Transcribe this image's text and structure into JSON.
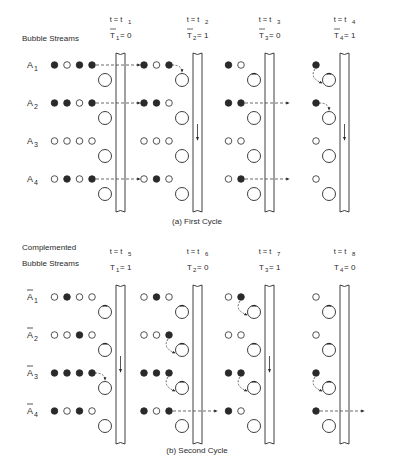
{
  "panels": [
    {
      "id": "a",
      "header_label": [
        "Bubble Streams"
      ],
      "caption": "(a) First Cycle",
      "row_labels": [
        "A1",
        "A2",
        "A3",
        "A4"
      ],
      "row_label_bar": false,
      "columns": [
        {
          "time": "t = t1",
          "time_sub": "1",
          "control": "T1 = 0",
          "control_name": "T",
          "control_sub": "1",
          "control_value": "0",
          "control_bar": true,
          "channel_flow_down": false,
          "rows": [
            {
              "bits": [
                1,
                0,
                1,
                1
              ],
              "hole_dot": false,
              "action": "transfer-out"
            },
            {
              "bits": [
                1,
                1,
                0,
                1
              ],
              "hole_dot": false,
              "action": "transfer-out"
            },
            {
              "bits": [
                0,
                0,
                0,
                0
              ],
              "hole_dot": false,
              "action": "none"
            },
            {
              "bits": [
                0,
                1,
                0,
                1
              ],
              "hole_dot": false,
              "action": "transfer-out"
            }
          ]
        },
        {
          "time": "t = t2",
          "time_sub": "2",
          "control": "T2 = 1",
          "control_name": "T",
          "control_sub": "2",
          "control_value": "1",
          "control_bar": true,
          "channel_flow_down": true,
          "rows": [
            {
              "bits": [
                1,
                0,
                1
              ],
              "hole_dot": false,
              "action": "drop-into-hole"
            },
            {
              "bits": [
                1,
                1,
                0
              ],
              "hole_dot": false,
              "action": "none"
            },
            {
              "bits": [
                0,
                0,
                0
              ],
              "hole_dot": false,
              "action": "none"
            },
            {
              "bits": [
                0,
                1,
                0
              ],
              "hole_dot": false,
              "action": "none"
            }
          ]
        },
        {
          "time": "t = t3",
          "time_sub": "3",
          "control": "T3 = 0",
          "control_name": "T",
          "control_sub": "3",
          "control_value": "0",
          "control_bar": true,
          "channel_flow_down": false,
          "rows": [
            {
              "bits": [
                1,
                0
              ],
              "hole_dot": true,
              "action": "none"
            },
            {
              "bits": [
                1,
                1
              ],
              "hole_dot": false,
              "action": "transfer-out"
            },
            {
              "bits": [
                0,
                0
              ],
              "hole_dot": false,
              "action": "none"
            },
            {
              "bits": [
                0,
                1
              ],
              "hole_dot": false,
              "action": "transfer-out"
            }
          ]
        },
        {
          "time": "t = t4",
          "time_sub": "4",
          "control": "T4 = 1",
          "control_name": "T",
          "control_sub": "4",
          "control_value": "1",
          "control_bar": true,
          "channel_flow_down": true,
          "rows": [
            {
              "bits": [
                1
              ],
              "hole_dot": true,
              "action": "curve-down"
            },
            {
              "bits": [
                1
              ],
              "hole_dot": false,
              "action": "drop-into-hole"
            },
            {
              "bits": [
                0
              ],
              "hole_dot": false,
              "action": "none"
            },
            {
              "bits": [
                0
              ],
              "hole_dot": false,
              "action": "none"
            }
          ]
        }
      ]
    },
    {
      "id": "b",
      "header_label": [
        "Complemented",
        "Bubble Streams"
      ],
      "caption": "(b) Second Cycle",
      "row_labels": [
        "Ā1",
        "Ā2",
        "Ā3",
        "Ā4"
      ],
      "row_label_bar": true,
      "columns": [
        {
          "time": "t = t5",
          "time_sub": "5",
          "control": "T1 = 1",
          "control_name": "T",
          "control_sub": "1",
          "control_value": "1",
          "control_bar": false,
          "channel_flow_down": true,
          "rows": [
            {
              "bits": [
                0,
                1,
                0,
                0
              ],
              "hole_dot": true,
              "action": "none"
            },
            {
              "bits": [
                0,
                0,
                1,
                0
              ],
              "hole_dot": true,
              "action": "none"
            },
            {
              "bits": [
                1,
                1,
                1,
                1
              ],
              "hole_dot": false,
              "action": "drop-into-hole"
            },
            {
              "bits": [
                1,
                0,
                1,
                0
              ],
              "hole_dot": false,
              "action": "none"
            }
          ]
        },
        {
          "time": "t = t6",
          "time_sub": "6",
          "control": "T2 = 0",
          "control_name": "T",
          "control_sub": "2",
          "control_value": "0",
          "control_bar": false,
          "channel_flow_down": false,
          "rows": [
            {
              "bits": [
                0,
                1,
                0
              ],
              "hole_dot": true,
              "action": "none"
            },
            {
              "bits": [
                0,
                0,
                1
              ],
              "hole_dot": true,
              "action": "curve-down"
            },
            {
              "bits": [
                1,
                1,
                1
              ],
              "hole_dot": true,
              "action": "curve-down"
            },
            {
              "bits": [
                1,
                0,
                1
              ],
              "hole_dot": false,
              "action": "transfer-out"
            }
          ]
        },
        {
          "time": "t = t7",
          "time_sub": "7",
          "control": "T3 = 1",
          "control_name": "T",
          "control_sub": "3",
          "control_value": "1",
          "control_bar": false,
          "channel_flow_down": true,
          "rows": [
            {
              "bits": [
                0,
                1
              ],
              "hole_dot": true,
              "action": "curve-down"
            },
            {
              "bits": [
                0,
                0
              ],
              "hole_dot": true,
              "action": "none"
            },
            {
              "bits": [
                1,
                1
              ],
              "hole_dot": true,
              "action": "curve-down"
            },
            {
              "bits": [
                1,
                0
              ],
              "hole_dot": false,
              "action": "none"
            }
          ]
        },
        {
          "time": "t = t8",
          "time_sub": "8",
          "control": "T4 = 0",
          "control_name": "T",
          "control_sub": "4",
          "control_value": "0",
          "control_bar": false,
          "channel_flow_down": false,
          "rows": [
            {
              "bits": [
                0
              ],
              "hole_dot": true,
              "action": "none"
            },
            {
              "bits": [
                0
              ],
              "hole_dot": true,
              "action": "none"
            },
            {
              "bits": [
                1
              ],
              "hole_dot": true,
              "action": "curve-down"
            },
            {
              "bits": [
                1
              ],
              "hole_dot": false,
              "action": "transfer-out"
            }
          ]
        }
      ]
    }
  ]
}
